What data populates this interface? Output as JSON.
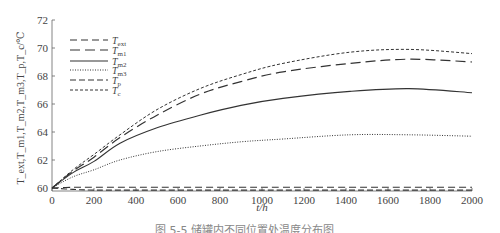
{
  "chart_data": {
    "type": "line",
    "title": "",
    "xlabel": "t/h",
    "ylabel": "T_ext,T_m1,T_m2,T_m3,T_p,T_c/℃",
    "xlim": [
      0,
      2000
    ],
    "ylim": [
      60,
      72
    ],
    "xticks": [
      0,
      200,
      400,
      600,
      800,
      1000,
      1200,
      1400,
      1600,
      1800,
      2000
    ],
    "yticks": [
      60,
      62,
      64,
      66,
      68,
      70,
      72
    ],
    "grid": false,
    "legend_position": "upper left",
    "x": [
      0,
      100,
      200,
      324,
      500,
      705,
      900,
      1100,
      1419,
      1700,
      2000
    ],
    "series": [
      {
        "name": "T_ext",
        "base": "T",
        "sub": "ext",
        "dash": "7,4",
        "width": 1.1,
        "values": [
          60.0,
          60.05,
          60.05,
          60.05,
          60.05,
          60.05,
          60.05,
          60.05,
          60.05,
          60.05,
          60.05
        ]
      },
      {
        "name": "T_m1",
        "base": "T",
        "sub": "m1",
        "dash": "10,5",
        "width": 1.2,
        "values": [
          60.0,
          61.2,
          62.2,
          63.6,
          65.2,
          66.7,
          67.6,
          68.3,
          68.9,
          69.2,
          69.0
        ]
      },
      {
        "name": "T_m2",
        "base": "T",
        "sub": "m2",
        "dash": "",
        "width": 1.1,
        "values": [
          60.0,
          61.1,
          61.9,
          63.2,
          64.3,
          65.2,
          65.9,
          66.4,
          66.9,
          67.1,
          66.8
        ]
      },
      {
        "name": "T_m3",
        "base": "T",
        "sub": "m3",
        "dash": "1,1.5",
        "width": 1.0,
        "values": [
          60.0,
          60.8,
          61.3,
          62.0,
          62.6,
          63.0,
          63.3,
          63.5,
          63.8,
          63.8,
          63.7
        ]
      },
      {
        "name": "T_p",
        "base": "T",
        "sub": "p",
        "dash": "6,3",
        "width": 1.1,
        "values": [
          60.0,
          59.9,
          59.85,
          59.85,
          59.85,
          59.85,
          59.85,
          59.85,
          59.85,
          59.85,
          59.85
        ]
      },
      {
        "name": "T_c",
        "base": "T",
        "sub": "c",
        "dash": "3,2",
        "width": 1.0,
        "values": [
          60.0,
          61.3,
          62.4,
          63.8,
          65.6,
          67.1,
          68.1,
          68.9,
          69.7,
          69.9,
          69.6
        ]
      }
    ]
  },
  "caption": "图 5-5 储罐内不同位置处温度分布图"
}
